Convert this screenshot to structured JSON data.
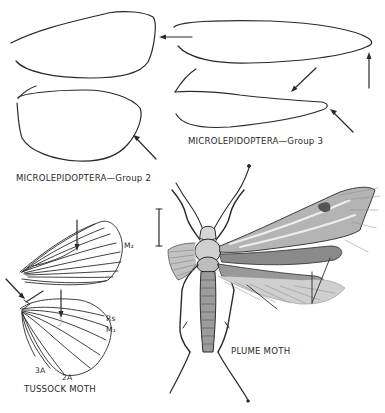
{
  "figure": {
    "background": "#ffffff",
    "ink_color": "#2a2a2a",
    "panels": [
      {
        "id": "group2",
        "caption": "MICROLEPIDOPTERA—Group 2",
        "elements": [
          "forewing-outline",
          "hindwing-outline",
          "arrow-forewing-apex",
          "arrow-hindwing-margin"
        ]
      },
      {
        "id": "group3",
        "caption": "MICROLEPIDOPTERA—Group 3",
        "elements": [
          "forewing-outline",
          "hindwing-outline",
          "arrow-forewing-apex",
          "arrow-hindwing-notch",
          "arrow-hindwing-apex"
        ]
      },
      {
        "id": "tussock",
        "caption": "TUSSOCK MOTH",
        "vein_labels": {
          "m2": "M₂",
          "rs": "Rs",
          "m1": "M₁",
          "a3": "3A",
          "a2": "2A"
        }
      },
      {
        "id": "plume",
        "caption": "PLUME MOTH",
        "scale_bar": true
      }
    ]
  }
}
